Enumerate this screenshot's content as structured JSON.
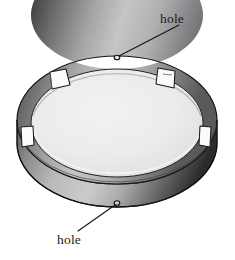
{
  "figure": {
    "view": "three-quarter perspective",
    "labels": [
      {
        "id": "hole-top",
        "text": "hole",
        "position": "top-right",
        "points_to": "far-rim-hole",
        "leader": {
          "from_x": 178,
          "from_y": 26,
          "to_x": 117,
          "to_y": 58
        }
      },
      {
        "id": "hole-bottom",
        "text": "hole",
        "position": "bottom-left",
        "points_to": "near-rim-hole",
        "leader": {
          "from_x": 79,
          "from_y": 230,
          "to_x": 117,
          "to_y": 203
        }
      }
    ],
    "features": {
      "holes": [
        {
          "name": "far-rim-hole",
          "cx": 117,
          "cy": 57,
          "r": 2.6
        },
        {
          "name": "near-rim-hole",
          "cx": 117,
          "cy": 203,
          "r": 2.6
        }
      ],
      "tabs": [
        {
          "name": "tab-upper-left",
          "cx": 58,
          "cy": 83
        },
        {
          "name": "tab-upper-right",
          "cx": 166,
          "cy": 82
        },
        {
          "name": "tab-left",
          "cx": 27,
          "cy": 136
        },
        {
          "name": "tab-right",
          "cx": 205,
          "cy": 135
        }
      ],
      "tab_count": 4,
      "hole_count": 2
    },
    "colors": {
      "background": "#ffffff",
      "outline": "#1a1a1a",
      "label_text": "#1a1a1a",
      "interior_floor": "#ececed",
      "interior_floor_edge": "#dcdcdd",
      "rim_dark": "#4a4a4c",
      "rim_darkest": "#232325",
      "rim_light": "#d2d2d3",
      "rim_mid": "#8e8e90",
      "outer_wall": "#b9b9ba",
      "tab_fill": "#fbfbfb"
    },
    "geometry": {
      "top_ellipse": {
        "cx": 117,
        "cy": 120,
        "rx": 100,
        "ry": 64
      },
      "inner_ellipse": {
        "cx": 117,
        "cy": 123,
        "rx": 86,
        "ry": 54
      },
      "wall_height": 36
    }
  }
}
